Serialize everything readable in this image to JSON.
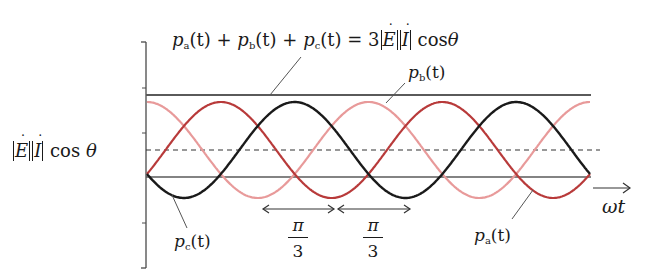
{
  "labels": {
    "equation": {
      "pa": "p",
      "pa_sub": "a",
      "t": "(t)",
      "plus": "+",
      "pb": "p",
      "pb_sub": "b",
      "pc": "p",
      "pc_sub": "c",
      "equals": "=",
      "coef": "3",
      "E": "E",
      "I": "I",
      "cos": "cos",
      "theta": "θ"
    },
    "avg_level": {
      "E": "E",
      "I": "I",
      "cos": "cos",
      "theta": "θ"
    },
    "pb_curve": {
      "p": "p",
      "sub": "b",
      "t": "(t)"
    },
    "pc_curve": {
      "p": "p",
      "sub": "c",
      "t": "(t)"
    },
    "pa_curve": {
      "p": "p",
      "sub": "a",
      "t": "(t)"
    },
    "x_axis": "ωt",
    "interval_1": {
      "num": "π",
      "den": "3"
    },
    "interval_2": {
      "num": "π",
      "den": "3"
    }
  },
  "colors": {
    "pa": "#b83a3a",
    "pb": "#e89a9a",
    "pc": "#1a1a1a",
    "axis": "#4a4a4a",
    "total": "#5a5a5a"
  },
  "geometry": {
    "x_start": 147,
    "x_end": 590,
    "period_px": 221.5,
    "zero_y": 177,
    "mean_y": 150,
    "amplitude_px": 48,
    "total_y": 95,
    "phases_deg": {
      "pb": 0,
      "pa": -120,
      "pc": -240
    }
  }
}
